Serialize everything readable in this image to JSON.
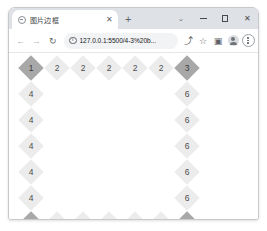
{
  "window": {
    "controls": {
      "tab_search_label": "⌄",
      "minimize_label": "–",
      "maximize_label": "□",
      "close_label": "✕"
    }
  },
  "tabs": {
    "items": [
      {
        "title": "图片边框",
        "close_label": "✕",
        "favicon": "globe-icon"
      }
    ],
    "new_tab_label": "+"
  },
  "toolbar": {
    "back_label": "←",
    "forward_label": "→",
    "reload_label": "↻",
    "omnibox": {
      "site_info_icon": "info-icon",
      "url": "127.0.0.1:5500/4-3%20b...",
      "placeholder": "Search Google or type a URL"
    },
    "share_label": "⤴",
    "bookmark_label": "☆",
    "side_panel_label": "▣",
    "profile_label": "profile-avatar",
    "menu_label": "chrome-menu-icon"
  },
  "grid": {
    "rows": [
      [
        {
          "value": "1",
          "kind": "corner"
        },
        {
          "value": "2",
          "kind": "edge"
        },
        {
          "value": "2",
          "kind": "edge"
        },
        {
          "value": "2",
          "kind": "edge"
        },
        {
          "value": "2",
          "kind": "edge"
        },
        {
          "value": "2",
          "kind": "edge"
        },
        {
          "value": "3",
          "kind": "corner"
        }
      ],
      [
        {
          "value": "4",
          "kind": "edge"
        },
        {
          "value": "",
          "kind": "empty"
        },
        {
          "value": "",
          "kind": "empty"
        },
        {
          "value": "",
          "kind": "empty"
        },
        {
          "value": "",
          "kind": "empty"
        },
        {
          "value": "",
          "kind": "empty"
        },
        {
          "value": "6",
          "kind": "edge"
        }
      ],
      [
        {
          "value": "4",
          "kind": "edge"
        },
        {
          "value": "",
          "kind": "empty"
        },
        {
          "value": "",
          "kind": "empty"
        },
        {
          "value": "",
          "kind": "empty"
        },
        {
          "value": "",
          "kind": "empty"
        },
        {
          "value": "",
          "kind": "empty"
        },
        {
          "value": "6",
          "kind": "edge"
        }
      ],
      [
        {
          "value": "4",
          "kind": "edge"
        },
        {
          "value": "",
          "kind": "empty"
        },
        {
          "value": "",
          "kind": "empty"
        },
        {
          "value": "",
          "kind": "empty"
        },
        {
          "value": "",
          "kind": "empty"
        },
        {
          "value": "",
          "kind": "empty"
        },
        {
          "value": "6",
          "kind": "edge"
        }
      ],
      [
        {
          "value": "4",
          "kind": "edge"
        },
        {
          "value": "",
          "kind": "empty"
        },
        {
          "value": "",
          "kind": "empty"
        },
        {
          "value": "",
          "kind": "empty"
        },
        {
          "value": "",
          "kind": "empty"
        },
        {
          "value": "",
          "kind": "empty"
        },
        {
          "value": "6",
          "kind": "edge"
        }
      ],
      [
        {
          "value": "4",
          "kind": "edge"
        },
        {
          "value": "",
          "kind": "empty"
        },
        {
          "value": "",
          "kind": "empty"
        },
        {
          "value": "",
          "kind": "empty"
        },
        {
          "value": "",
          "kind": "empty"
        },
        {
          "value": "",
          "kind": "empty"
        },
        {
          "value": "6",
          "kind": "edge"
        }
      ],
      [
        {
          "value": "7",
          "kind": "corner"
        },
        {
          "value": "8",
          "kind": "edge"
        },
        {
          "value": "8",
          "kind": "edge"
        },
        {
          "value": "8",
          "kind": "edge"
        },
        {
          "value": "8",
          "kind": "edge"
        },
        {
          "value": "8",
          "kind": "edge"
        },
        {
          "value": "9",
          "kind": "corner"
        }
      ]
    ]
  },
  "colors": {
    "corner_fill": "#a8a8a8",
    "edge_fill": "#ececec",
    "tabstrip_bg": "#dee1e6",
    "omnibox_bg": "#f1f3f4",
    "page_bg": "#ffffff"
  }
}
